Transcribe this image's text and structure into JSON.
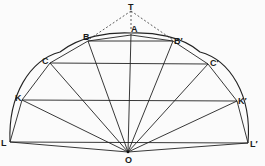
{
  "diagram": {
    "type": "geometric-construction",
    "colors": {
      "line": "#222222",
      "dashed": "#333333",
      "background": "#fbfbfb"
    },
    "points": {
      "T": {
        "label": "T",
        "x": 131,
        "y": 10
      },
      "A": {
        "label": "A",
        "x": 131,
        "y": 34
      },
      "B": {
        "label": "B",
        "x": 88,
        "y": 41
      },
      "B_prime": {
        "label": "B′",
        "x": 173,
        "y": 41
      },
      "C": {
        "label": "C",
        "x": 50,
        "y": 63
      },
      "C_prime": {
        "label": "C′",
        "x": 208,
        "y": 64
      },
      "K": {
        "label": "K",
        "x": 22,
        "y": 100
      },
      "K_prime": {
        "label": "K′",
        "x": 237,
        "y": 101
      },
      "L": {
        "label": "L",
        "x": 10,
        "y": 142
      },
      "L_prime": {
        "label": "L′",
        "x": 248,
        "y": 143
      },
      "O": {
        "label": "O",
        "x": 128,
        "y": 152
      }
    },
    "chords": [
      "BB′",
      "CC′",
      "KK′",
      "LL′"
    ],
    "radii": [
      "OA",
      "OB",
      "OB′",
      "OC",
      "OC′",
      "OK",
      "OK′",
      "OL",
      "OL′"
    ],
    "dashed": [
      "TB",
      "TB′",
      "TA"
    ]
  }
}
